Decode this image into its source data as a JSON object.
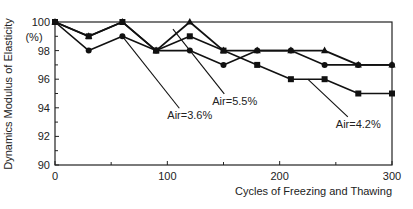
{
  "chart_data": {
    "type": "line",
    "title": "",
    "xlabel": "Cycles of Freezing and Thawing",
    "ylabel": "Dynamics Modulus of Elasticity",
    "ylabel_unit": "(%)",
    "xlim": [
      0,
      300
    ],
    "ylim": [
      90,
      100
    ],
    "xticks": [
      0,
      100,
      200,
      300
    ],
    "xminor": [
      50,
      150,
      250
    ],
    "yticks": [
      90,
      92,
      94,
      96,
      98,
      100
    ],
    "yminor": [
      91,
      93,
      95,
      97,
      99
    ],
    "grid": false,
    "x": [
      0,
      30,
      60,
      90,
      120,
      150,
      180,
      210,
      240,
      270,
      300
    ],
    "series": [
      {
        "name": "Air=5.5%",
        "marker": "triangle",
        "values": [
          100,
          99,
          100,
          98,
          100,
          98,
          98,
          98,
          98,
          97,
          97
        ]
      },
      {
        "name": "Air=4.2%",
        "marker": "square",
        "values": [
          100,
          99,
          100,
          98,
          99,
          98,
          97,
          96,
          96,
          95,
          95
        ]
      },
      {
        "name": "Air=3.6%",
        "marker": "circle",
        "values": [
          100,
          98,
          99,
          98,
          98,
          97,
          98,
          98,
          97,
          97,
          97
        ]
      }
    ],
    "annotations": [
      {
        "text": "Air=3.6%",
        "series": "Air=3.6%",
        "point_x": 60,
        "point_y": 99,
        "label_x": 100,
        "label_y": 93.2
      },
      {
        "text": "Air=5.5%",
        "series": "Air=5.5%",
        "point_x": 105,
        "point_y": 99.5,
        "label_x": 140,
        "label_y": 94.2
      },
      {
        "text": "Air=4.2%",
        "series": "Air=4.2%",
        "point_x": 225,
        "point_y": 96,
        "label_x": 250,
        "label_y": 92.6
      }
    ],
    "legend": "none (inline annotations)",
    "colors": {
      "line": "#111111",
      "frame": "#222222"
    }
  }
}
